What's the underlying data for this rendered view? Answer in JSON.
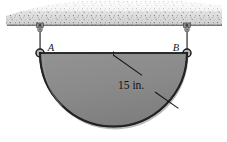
{
  "figure": {
    "background_color": "#ffffff"
  },
  "ceiling": {
    "name": "hatched-ceiling-support",
    "fill_color": "#c9c9c9",
    "edge_color": "#5a5a5a",
    "stipple_color": "#6e6e6e",
    "line_y": 25,
    "left_x": 8,
    "right_x": 222
  },
  "supports": [
    {
      "id": "A",
      "label": "A",
      "label_x": 51,
      "label_y": 51,
      "anchor_x": 40,
      "anchor_y": 25,
      "pin_x": 40,
      "pin_y": 53,
      "rod_color": "#707070",
      "pin_fill": "#b5b5b5",
      "pin_stroke": "#1c1c1c"
    },
    {
      "id": "B",
      "label": "B",
      "label_x": 175,
      "label_y": 51,
      "anchor_x": 187,
      "anchor_y": 25,
      "pin_x": 187,
      "pin_y": 53,
      "rod_color": "#707070",
      "pin_fill": "#b5b5b5",
      "pin_stroke": "#1c1c1c"
    }
  ],
  "plate": {
    "name": "semicircular-plate",
    "shape": "semicircle",
    "center_x": 113.5,
    "center_y": 53,
    "radius_px": 73.5,
    "fill_color": "#8a8a8a",
    "edge_color": "#2a2a2a",
    "top_edge_color": "#1f1f1f"
  },
  "dimension": {
    "name": "radius-dimension",
    "label": "15 in.",
    "value": 15,
    "unit": "in.",
    "label_x": 118,
    "label_y": 88,
    "leader_start_x": 113.5,
    "leader_start_y": 54,
    "leader_mid_x": 150,
    "leader_mid_y": 80,
    "leader_end_x": 178,
    "leader_end_y": 106,
    "line_color": "#1a1a1a"
  }
}
